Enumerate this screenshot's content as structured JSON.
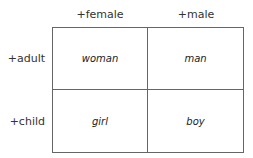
{
  "diagram": {
    "columns": [
      {
        "label": "+female"
      },
      {
        "label": "+male"
      }
    ],
    "rows": [
      {
        "label": "+adult"
      },
      {
        "label": "+child"
      }
    ],
    "cells": [
      [
        "woman",
        "man"
      ],
      [
        "girl",
        "boy"
      ]
    ],
    "colors": {
      "border": "#666666",
      "text": "#222222",
      "background": "#ffffff"
    }
  }
}
